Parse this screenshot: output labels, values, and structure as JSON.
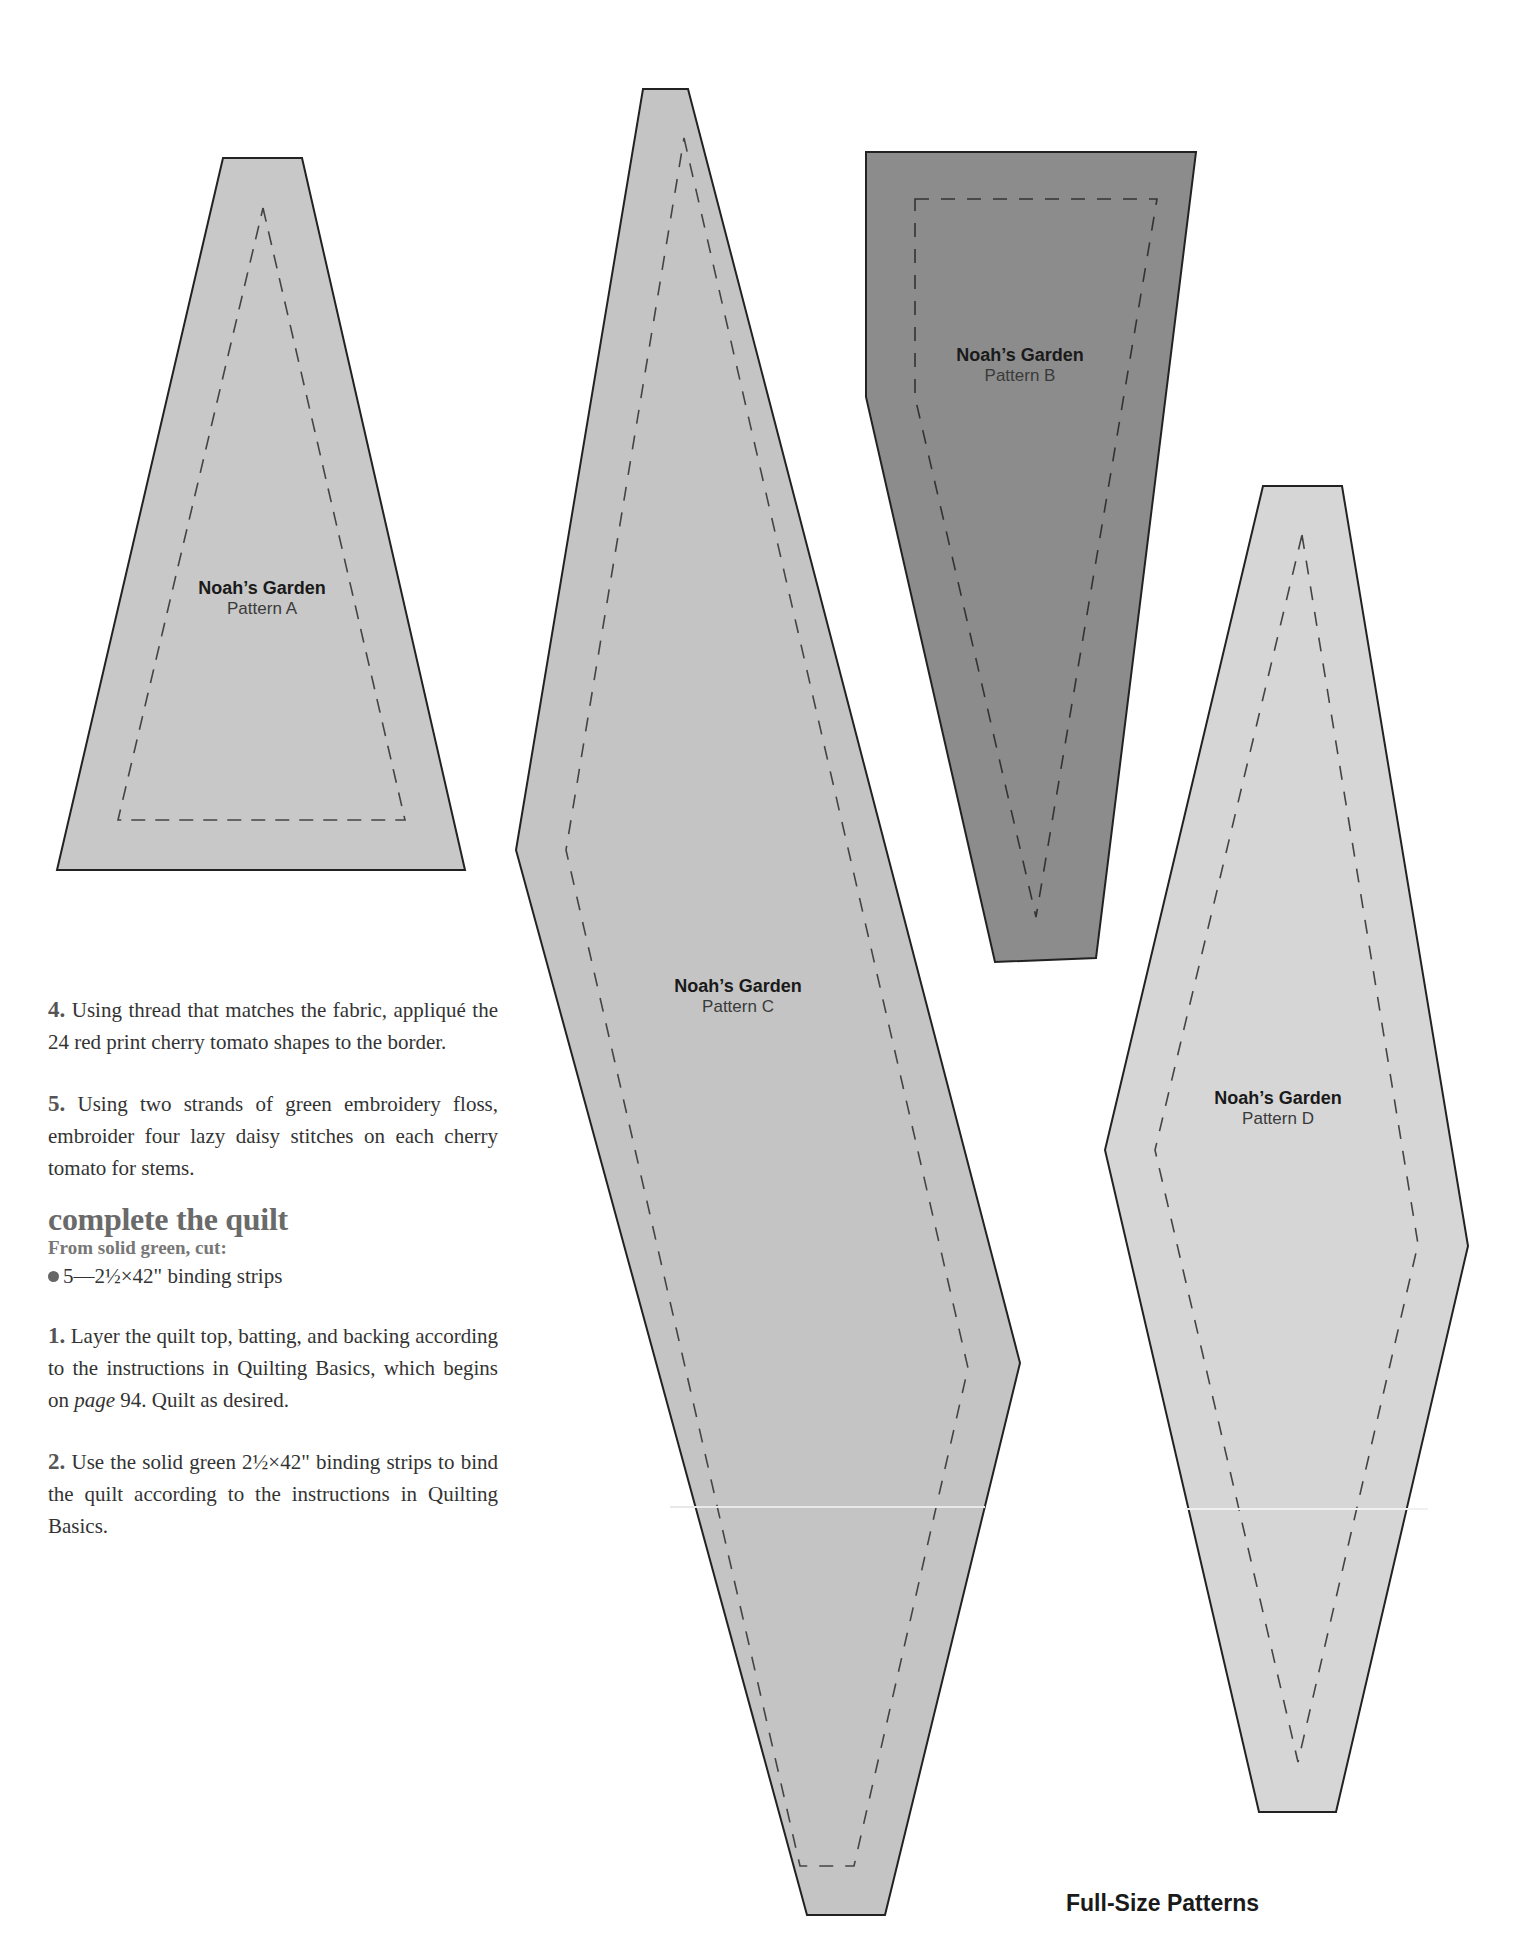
{
  "patterns": [
    {
      "id": "A",
      "title": "Noah’s Garden",
      "subtitle": "Pattern A",
      "fill": "#c8c8c8"
    },
    {
      "id": "B",
      "title": "Noah’s Garden",
      "subtitle": "Pattern B",
      "fill": "#8c8c8c"
    },
    {
      "id": "C",
      "title": "Noah’s Garden",
      "subtitle": "Pattern C",
      "fill": "#c4c4c4"
    },
    {
      "id": "D",
      "title": "Noah’s Garden",
      "subtitle": "Pattern D",
      "fill": "#d6d6d6"
    }
  ],
  "steps_top": [
    {
      "num": "4.",
      "text": "Using thread that matches the fabric, appliqué the 24 red print cherry tomato shapes to the border."
    },
    {
      "num": "5.",
      "text": "Using two strands of green embroidery floss, embroider four lazy daisy stitches on each cherry tomato for stems."
    }
  ],
  "section": {
    "heading": "complete the quilt",
    "subheading": "From solid green, cut:",
    "bullet": "5—2½×42\" binding strips"
  },
  "steps_bottom": [
    {
      "num": "1.",
      "text_before": "Layer the quilt top, batting, and backing according to the instructions in Quilting Basics, which begins on ",
      "page_word": "page",
      "text_after": " 94. Quilt as desired."
    },
    {
      "num": "2.",
      "text": "Use the solid green 2½×42\" binding strips to bind the quilt according to the instructions in Quilting Basics."
    }
  ],
  "footer": "Full-Size Patterns"
}
